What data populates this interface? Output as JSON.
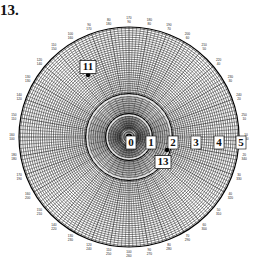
{
  "figure": {
    "label": "13.",
    "center": [
      129,
      137
    ],
    "outer_radius": 110,
    "inner_rings": [
      22,
      42
    ],
    "colors": {
      "grid": "#1a1a1a",
      "background": "#ffffff",
      "label_box": "#ffffff"
    }
  },
  "radial_labels": [
    "0",
    "1",
    "2",
    "3",
    "4",
    "5"
  ],
  "angle_tick_labels": [
    {
      "outer": "170",
      "inner": "90"
    },
    {
      "outer": "180",
      "inner": "80"
    },
    {
      "outer": "190",
      "inner": "70"
    },
    {
      "outer": "200",
      "inner": "60"
    },
    {
      "outer": "210",
      "inner": "50"
    },
    {
      "outer": "220",
      "inner": "40"
    },
    {
      "outer": "230",
      "inner": "30"
    },
    {
      "outer": "240",
      "inner": "20"
    },
    {
      "outer": "250",
      "inner": "10"
    },
    {
      "outer": "10",
      "inner": "350"
    },
    {
      "outer": "20",
      "inner": "340"
    },
    {
      "outer": "30",
      "inner": "330"
    },
    {
      "outer": "40",
      "inner": "320"
    },
    {
      "outer": "50",
      "inner": "310"
    },
    {
      "outer": "60",
      "inner": "300"
    },
    {
      "outer": "70",
      "inner": "290"
    },
    {
      "outer": "80",
      "inner": "280"
    },
    {
      "outer": "90",
      "inner": "270"
    },
    {
      "outer": "100",
      "inner": "260"
    },
    {
      "outer": "110",
      "inner": "250"
    },
    {
      "outer": "120",
      "inner": "240"
    },
    {
      "outer": "130",
      "inner": "230"
    },
    {
      "outer": "140",
      "inner": "220"
    },
    {
      "outer": "150",
      "inner": "210"
    },
    {
      "outer": "160",
      "inner": "200"
    },
    {
      "outer": "170",
      "inner": "190"
    },
    {
      "outer": "180",
      "inner": "180"
    },
    {
      "outer": "160",
      "inner": "100"
    },
    {
      "outer": "150",
      "inner": "110"
    },
    {
      "outer": "140",
      "inner": "120"
    },
    {
      "outer": "130",
      "inner": "130"
    },
    {
      "outer": "120",
      "inner": "140"
    },
    {
      "outer": "110",
      "inner": "150"
    },
    {
      "outer": "100",
      "inner": "160"
    },
    {
      "outer": "90",
      "inner": "170"
    },
    {
      "outer": "80",
      "inner": "180"
    }
  ],
  "points": [
    {
      "id": "11",
      "label": "11",
      "x": 88,
      "y": 75,
      "label_x": 88,
      "label_y": 67
    },
    {
      "id": "13",
      "label": "13",
      "x": 167,
      "y": 150,
      "label_x": 163,
      "label_y": 162
    }
  ]
}
